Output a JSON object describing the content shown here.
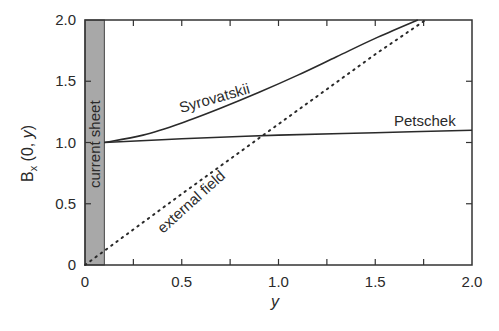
{
  "chart_data": {
    "type": "line",
    "title": "",
    "xlabel": "y",
    "ylabel": "B_x (0, y)",
    "xlim": [
      0,
      2.0
    ],
    "ylim": [
      0,
      2.0
    ],
    "grid": false,
    "legend": "none (inline curve labels)",
    "x_ticks": [
      "0",
      "0.5",
      "1.0",
      "1.5",
      "2.0"
    ],
    "y_ticks": [
      "0",
      "0.5",
      "1.0",
      "1.5",
      "2.0"
    ],
    "shaded_region": {
      "label": "current sheet",
      "x_range": [
        0,
        0.1
      ],
      "color": "#a8a8a8"
    },
    "series": [
      {
        "name": "Syrovatskii",
        "style": "solid",
        "x": [
          0.1,
          0.3,
          0.5,
          0.7,
          0.9,
          1.1,
          1.3,
          1.5,
          1.72
        ],
        "values": [
          1.0,
          1.06,
          1.16,
          1.28,
          1.41,
          1.55,
          1.7,
          1.85,
          2.0
        ]
      },
      {
        "name": "Petschek",
        "style": "solid",
        "x": [
          0.1,
          0.5,
          1.0,
          1.5,
          2.0
        ],
        "values": [
          1.0,
          1.03,
          1.06,
          1.08,
          1.1
        ]
      },
      {
        "name": "external field",
        "style": "dotted",
        "x": [
          0.0,
          0.5,
          1.0,
          1.5,
          1.76
        ],
        "values": [
          0.0,
          0.58,
          1.15,
          1.72,
          2.0
        ]
      }
    ],
    "annotations": [
      "current sheet",
      "Syrovatskii",
      "Petschek",
      "external field"
    ]
  },
  "labels": {
    "ylabel_main": "B",
    "ylabel_sub": "x",
    "ylabel_args": " (0, ",
    "ylabel_var": "y",
    "ylabel_close": ")",
    "xlabel": "y",
    "current_sheet": "current sheet",
    "syrovatskii": "Syrovatskii",
    "petschek": "Petschek",
    "external_field": "external field"
  }
}
